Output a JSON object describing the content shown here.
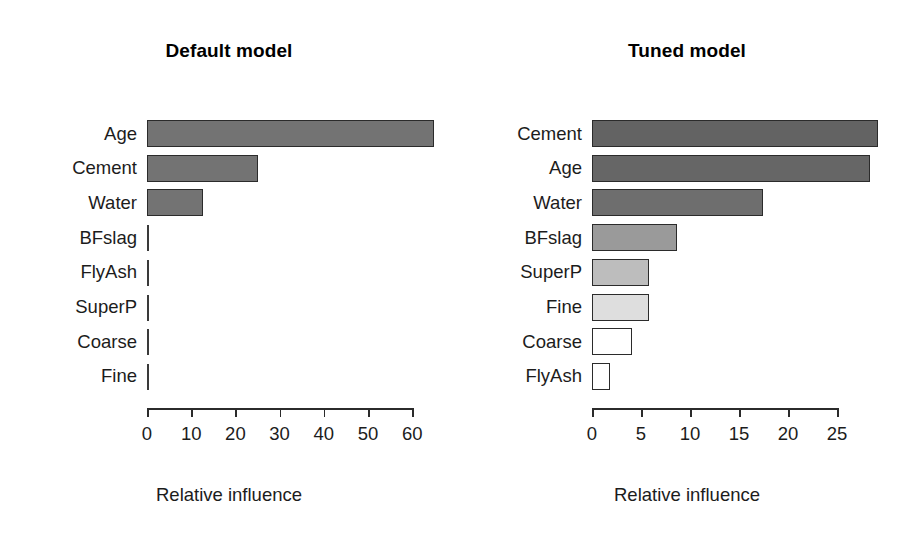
{
  "figure": {
    "width": 916,
    "height": 537,
    "background": "#ffffff"
  },
  "panels": [
    {
      "id": "default-model",
      "title": "Default model",
      "axis_title": "Relative influence"
    },
    {
      "id": "tuned-model",
      "title": "Tuned model",
      "axis_title": "Relative influence"
    }
  ],
  "chart_data": [
    {
      "type": "bar",
      "orientation": "horizontal",
      "title": "Default model",
      "xlabel": "Relative influence",
      "ylabel": "",
      "categories": [
        "Age",
        "Cement",
        "Water",
        "BFslag",
        "FlyAsh",
        "SuperP",
        "Coarse",
        "Fine"
      ],
      "values": [
        65.0,
        25.0,
        12.7,
        0.0,
        0.0,
        0.0,
        0.0,
        0.0
      ],
      "xlim": [
        0,
        65
      ],
      "xticks": [
        0,
        10,
        20,
        30,
        40,
        50,
        60
      ],
      "xticklabels": [
        "0",
        "10",
        "20",
        "30",
        "40",
        "50",
        "60"
      ],
      "grid": false,
      "legend": false,
      "bar_colors": [
        "#737373",
        "#737373",
        "#737373",
        "#3a3a3a",
        "#3a3a3a",
        "#3a3a3a",
        "#3a3a3a",
        "#3a3a3a"
      ]
    },
    {
      "type": "bar",
      "orientation": "horizontal",
      "title": "Tuned model",
      "xlabel": "Relative influence",
      "ylabel": "",
      "categories": [
        "Cement",
        "Age",
        "Water",
        "BFslag",
        "SuperP",
        "Fine",
        "Coarse",
        "FlyAsh"
      ],
      "values": [
        29.2,
        28.4,
        17.4,
        8.7,
        5.8,
        5.8,
        4.1,
        1.8
      ],
      "xlim": [
        0,
        29.5
      ],
      "xticks": [
        0,
        5,
        10,
        15,
        20,
        25
      ],
      "xticklabels": [
        "0",
        "5",
        "10",
        "15",
        "20",
        "25"
      ],
      "grid": false,
      "legend": false,
      "bar_colors": [
        "#636363",
        "#666666",
        "#6e6e6e",
        "#9a9a9a",
        "#bdbdbd",
        "#dedede",
        "#ffffff",
        "#ffffff"
      ]
    }
  ],
  "geometry": {
    "left_panel": {
      "x0_px": 147,
      "px_per_unit": 4.42,
      "row_top_px": 120,
      "row_height_px": 34.7,
      "bar_height_px": 27,
      "axis_y_px": 408,
      "tick_label_y_px": 425,
      "axis_title_y_px": 484,
      "label_right_px": 137
    },
    "right_panel": {
      "x0_px": 134,
      "px_per_unit": 9.8,
      "row_top_px": 120,
      "row_height_px": 34.7,
      "bar_height_px": 27,
      "axis_y_px": 408,
      "tick_label_y_px": 425,
      "axis_title_y_px": 484,
      "label_right_px": 124
    }
  }
}
